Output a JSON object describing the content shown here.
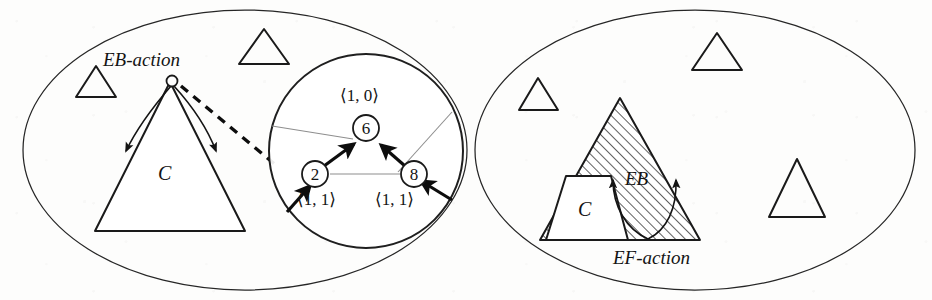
{
  "figure": {
    "background_color": "#fdfdfc",
    "ink_color": "#141414"
  },
  "left_panel": {
    "name": "EB-action panel",
    "action_label": "EB-action",
    "tree_label": "C",
    "magnifier": {
      "name": "zoomed graph detail",
      "nodes": [
        {
          "id": "6",
          "label": "6",
          "tuple": "⟨1, 0⟩",
          "tuple_position": "above"
        },
        {
          "id": "2",
          "label": "2",
          "tuple": "⟨1, 1⟩",
          "tuple_position": "below"
        },
        {
          "id": "8",
          "label": "8",
          "tuple": "⟨1, 1⟩",
          "tuple_position": "below"
        }
      ],
      "edges": [
        {
          "from": "2",
          "to": "6",
          "style": "bold-arrow"
        },
        {
          "from": "8",
          "to": "6",
          "style": "bold-arrow"
        },
        {
          "from": "2",
          "to": "8",
          "style": "thin-gray"
        },
        {
          "from": "boundary-left",
          "to": "6",
          "style": "thin-gray"
        },
        {
          "from": "8",
          "to": "boundary-upper-right",
          "style": "thin-gray"
        },
        {
          "from": "boundary-lower-left",
          "to": "2",
          "style": "bold-arrow"
        },
        {
          "from": "boundary-lower-right",
          "to": "8",
          "style": "bold-arrow"
        }
      ]
    },
    "small_triangles": 2
  },
  "right_panel": {
    "name": "EF-action panel",
    "action_label": "EF-action",
    "region_label": "EB",
    "tree_label": "C",
    "hatched_region": true,
    "small_triangles": 3
  }
}
